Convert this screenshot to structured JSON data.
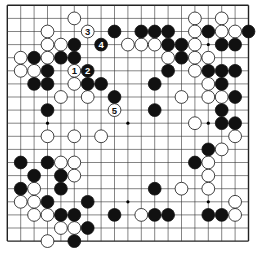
{
  "board": {
    "size": 19,
    "origin_x": 7.3,
    "origin_y": 5.3,
    "step_x": 13.4,
    "step_y": 13.1,
    "line_color": "#333333",
    "border_color": "#222222",
    "hoshi": [
      [
        3,
        3
      ],
      [
        9,
        3
      ],
      [
        15,
        3
      ],
      [
        3,
        9
      ],
      [
        9,
        9
      ],
      [
        15,
        9
      ],
      [
        3,
        15
      ],
      [
        9,
        15
      ],
      [
        15,
        15
      ]
    ]
  },
  "stones": {
    "white": [
      [
        5,
        1
      ],
      [
        14,
        1
      ],
      [
        16,
        1
      ],
      [
        3,
        2
      ],
      [
        14,
        2
      ],
      [
        16,
        2
      ],
      [
        17,
        2
      ],
      [
        3,
        3
      ],
      [
        4,
        3
      ],
      [
        9,
        3
      ],
      [
        10,
        3
      ],
      [
        11,
        3
      ],
      [
        14,
        3
      ],
      [
        1,
        4
      ],
      [
        3,
        4
      ],
      [
        12,
        4
      ],
      [
        14,
        4
      ],
      [
        15,
        4
      ],
      [
        1,
        5
      ],
      [
        2,
        5
      ],
      [
        14,
        5
      ],
      [
        5,
        6
      ],
      [
        15,
        6
      ],
      [
        4,
        7
      ],
      [
        6,
        7
      ],
      [
        13,
        7
      ],
      [
        15,
        7
      ],
      [
        16,
        7
      ],
      [
        14,
        9
      ],
      [
        3,
        10
      ],
      [
        5,
        10
      ],
      [
        7,
        10
      ],
      [
        17,
        10
      ],
      [
        16,
        11
      ],
      [
        4,
        12
      ],
      [
        5,
        12
      ],
      [
        15,
        12
      ],
      [
        5,
        13
      ],
      [
        15,
        13
      ],
      [
        2,
        14
      ],
      [
        13,
        14
      ],
      [
        15,
        14
      ],
      [
        1,
        15
      ],
      [
        2,
        15
      ],
      [
        17,
        15
      ],
      [
        2,
        16
      ],
      [
        3,
        16
      ],
      [
        10,
        16
      ],
      [
        17,
        16
      ],
      [
        4,
        17
      ],
      [
        5,
        17
      ],
      [
        3,
        18
      ]
    ],
    "black": [
      [
        8,
        2
      ],
      [
        10,
        2
      ],
      [
        11,
        2
      ],
      [
        12,
        2
      ],
      [
        15,
        2
      ],
      [
        18,
        2
      ],
      [
        5,
        3
      ],
      [
        12,
        3
      ],
      [
        13,
        3
      ],
      [
        16,
        3
      ],
      [
        17,
        3
      ],
      [
        2,
        4
      ],
      [
        4,
        4
      ],
      [
        5,
        4
      ],
      [
        13,
        4
      ],
      [
        3,
        5
      ],
      [
        12,
        5
      ],
      [
        15,
        5
      ],
      [
        16,
        5
      ],
      [
        17,
        5
      ],
      [
        2,
        6
      ],
      [
        3,
        6
      ],
      [
        6,
        6
      ],
      [
        7,
        6
      ],
      [
        11,
        6
      ],
      [
        16,
        6
      ],
      [
        8,
        7
      ],
      [
        17,
        7
      ],
      [
        3,
        8
      ],
      [
        11,
        8
      ],
      [
        16,
        8
      ],
      [
        16,
        9
      ],
      [
        17,
        9
      ],
      [
        15,
        11
      ],
      [
        1,
        12
      ],
      [
        3,
        12
      ],
      [
        14,
        12
      ],
      [
        2,
        13
      ],
      [
        4,
        13
      ],
      [
        1,
        14
      ],
      [
        4,
        14
      ],
      [
        11,
        14
      ],
      [
        3,
        15
      ],
      [
        6,
        15
      ],
      [
        4,
        16
      ],
      [
        5,
        16
      ],
      [
        8,
        16
      ],
      [
        11,
        16
      ],
      [
        12,
        16
      ],
      [
        15,
        16
      ],
      [
        16,
        16
      ],
      [
        6,
        17
      ],
      [
        5,
        18
      ]
    ],
    "numbered": [
      {
        "label": "1",
        "color": "white",
        "pos": [
          5,
          5
        ]
      },
      {
        "label": "2",
        "color": "black",
        "pos": [
          6,
          5
        ]
      },
      {
        "label": "3",
        "color": "white",
        "pos": [
          6,
          2
        ]
      },
      {
        "label": "4",
        "color": "black",
        "pos": [
          7,
          3
        ]
      },
      {
        "label": "5",
        "color": "white",
        "pos": [
          8,
          8
        ]
      }
    ]
  }
}
